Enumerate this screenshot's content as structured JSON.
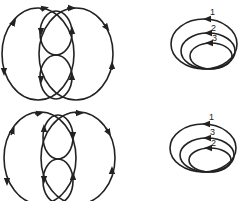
{
  "diagram": {
    "top_left": {
      "type": "two-overlapping-loops-with-arrows"
    },
    "bottom_left": {
      "type": "two-overlapping-loops-with-arrows"
    },
    "top_right": {
      "type": "nested-ellipses",
      "labels": [
        "1",
        "2",
        "3"
      ]
    },
    "bottom_right": {
      "type": "nested-ellipses",
      "labels": [
        "1",
        "3",
        "2"
      ]
    },
    "stroke_color": "#222222"
  }
}
